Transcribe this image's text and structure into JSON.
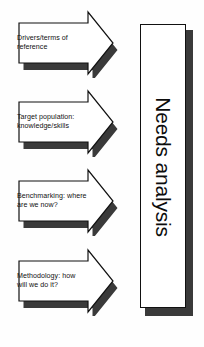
{
  "diagram": {
    "title": "Needs analysis",
    "background_color": "#fefefe",
    "outline_color": "#111111",
    "shadow_color": "#3a3a3a",
    "fill_color": "#ffffff",
    "arrows": [
      {
        "id": "drivers-terms-of-reference",
        "text": "Drivers/terms of\nreference",
        "line1": "Drivers/terms of",
        "line2": "reference",
        "order": 1
      },
      {
        "id": "target-population",
        "text": "Target population:\nknowledge/skills",
        "line1": "Target population:",
        "line2": "knowledge/skills",
        "order": 2
      },
      {
        "id": "benchmarking",
        "text": "Benchmarking: where\nare we now?",
        "line1": "Benchmarking: where",
        "line2": "are we now?",
        "order": 3
      },
      {
        "id": "methodology",
        "text": "Methodology: how\nwill we do it?",
        "line1": "Methodology: how",
        "line2": "will we do it?",
        "order": 4
      }
    ],
    "target": {
      "label": "Needs analysis",
      "orientation": "vertical-90cw"
    }
  }
}
